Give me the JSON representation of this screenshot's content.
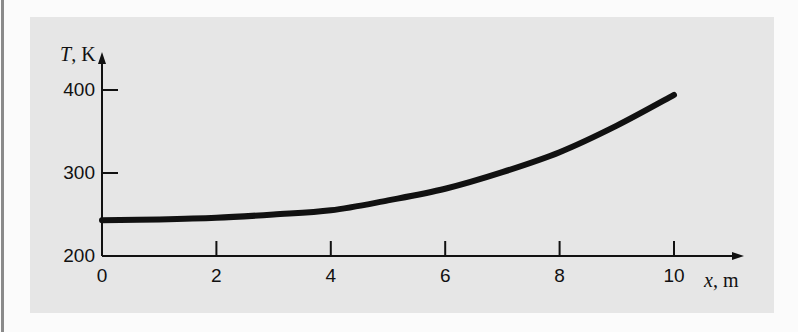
{
  "chart_data": {
    "type": "line",
    "title": "",
    "xlabel": "x, m",
    "ylabel": "T, K",
    "xlabel_var": "x",
    "xlabel_unit": ", m",
    "ylabel_var": "T",
    "ylabel_unit": ", K",
    "xlim": [
      0,
      10
    ],
    "ylim": [
      200,
      400
    ],
    "x_ticks": [
      0,
      2,
      4,
      6,
      8,
      10
    ],
    "x_tick_labels": [
      "0",
      "2",
      "4",
      "6",
      "8",
      "10"
    ],
    "y_ticks": [
      200,
      300,
      400
    ],
    "y_tick_labels": [
      "200",
      "300",
      "400"
    ],
    "grid": false,
    "legend": null,
    "series": [
      {
        "name": "T(x)",
        "color": "#111111",
        "x": [
          0,
          1,
          2,
          3,
          4,
          5,
          6,
          7,
          8,
          9,
          10
        ],
        "values": [
          243,
          244,
          246,
          250,
          255,
          267,
          281,
          301,
          325,
          357,
          394
        ]
      }
    ]
  },
  "colors": {
    "panel_background": "#e6e6e6",
    "page_background": "#fbfbfb",
    "ink": "#111111"
  }
}
